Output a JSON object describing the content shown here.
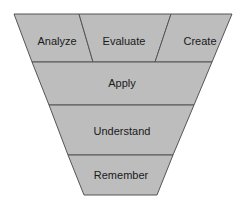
{
  "diagram": {
    "type": "inverted-pyramid",
    "fill_color": "#bdbdbd",
    "stroke_color": "#555555",
    "top_row": [
      {
        "label": "Analyze"
      },
      {
        "label": "Evaluate"
      },
      {
        "label": "Create"
      }
    ],
    "layers": [
      {
        "label": "Apply"
      },
      {
        "label": "Understand"
      },
      {
        "label": "Remember"
      }
    ]
  }
}
